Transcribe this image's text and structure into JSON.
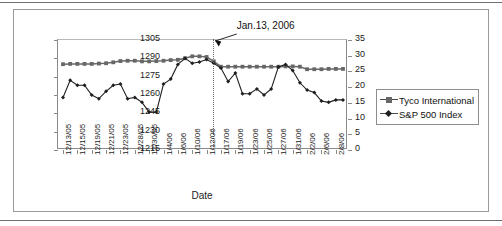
{
  "figure": {
    "xaxis_title": "Date",
    "annotation": "Jan.13, 2006",
    "legend": [
      {
        "label": "Tyco International",
        "marker": "square",
        "color": "#676767"
      },
      {
        "label": "S&P 500 Index",
        "marker": "diamond",
        "color": "#1f1f1f"
      }
    ]
  },
  "chart_data": {
    "type": "line",
    "title": "",
    "xlabel": "Date",
    "ylabel": "",
    "grid": false,
    "legend_position": "right",
    "annotations": [
      {
        "text": "Jan.13, 2006",
        "x": "1/13/06",
        "style": "dotted-vertical-line-with-arrow"
      }
    ],
    "x": [
      "12/13/05",
      "12/14/05",
      "12/15/05",
      "12/16/05",
      "12/19/05",
      "12/20/05",
      "12/21/05",
      "12/22/05",
      "12/23/05",
      "12/27/05",
      "12/28/05",
      "12/29/05",
      "12/30/05",
      "1/3/06",
      "1/4/06",
      "1/5/06",
      "1/6/06",
      "1/9/06",
      "1/10/06",
      "1/11/06",
      "1/12/06",
      "1/13/06",
      "1/17/06",
      "1/18/06",
      "1/19/06",
      "1/20/06",
      "1/23/06",
      "1/24/06",
      "1/25/06",
      "1/26/06",
      "1/27/06",
      "1/30/06",
      "1/31/06",
      "2/1/06",
      "2/2/06",
      "2/3/06",
      "2/6/06",
      "2/7/06",
      "2/8/06",
      "2/9/06"
    ],
    "xtick_labels": [
      "12/13/05",
      "12/15/05",
      "12/19/05",
      "12/21/05",
      "12/23/05",
      "12/28/05",
      "12/30/05",
      "1/4/06",
      "1/6/06",
      "1/10/06",
      "1/12/06",
      "1/17/06",
      "1/19/06",
      "1/23/06",
      "1/25/06",
      "1/27/06",
      "1/31/06",
      "2/2/06",
      "2/6/06",
      "2/8/06"
    ],
    "axes": {
      "left": {
        "name": "S&P 500 Index",
        "ticks": [
          1215,
          1230,
          1245,
          1260,
          1275,
          1290,
          1305
        ],
        "ylim": [
          1215,
          1305
        ]
      },
      "right": {
        "name": "Tyco International",
        "ticks": [
          0,
          5,
          10,
          15,
          20,
          25,
          30,
          35
        ],
        "ylim": [
          0,
          35
        ]
      }
    },
    "series": [
      {
        "name": "Tyco International",
        "axis": "right",
        "marker": "square",
        "color": "#676767",
        "values": [
          27.3,
          27.4,
          27.4,
          27.4,
          27.4,
          27.5,
          27.6,
          27.9,
          28.3,
          28.4,
          28.4,
          28.2,
          28.2,
          28.3,
          28.4,
          28.6,
          28.7,
          29.2,
          29.8,
          29.8,
          29.6,
          28.2,
          26.5,
          26.5,
          26.5,
          26.5,
          26.5,
          26.5,
          26.5,
          26.5,
          26.5,
          26.6,
          26.6,
          26.5,
          25.7,
          25.7,
          25.7,
          25.8,
          25.8,
          25.8
        ]
      },
      {
        "name": "S&P 500 Index",
        "axis": "left",
        "marker": "diamond",
        "color": "#1f1f1f",
        "values": [
          1258,
          1272,
          1268,
          1268,
          1260,
          1257,
          1263,
          1268,
          1269,
          1257,
          1258,
          1254,
          1246,
          1246,
          1269,
          1273,
          1285,
          1290,
          1286,
          1287,
          1289,
          1286,
          1282,
          1271,
          1278,
          1261,
          1261,
          1265,
          1260,
          1265,
          1283,
          1285,
          1280,
          1270,
          1264,
          1262,
          1255,
          1254,
          1256,
          1256
        ]
      }
    ]
  }
}
